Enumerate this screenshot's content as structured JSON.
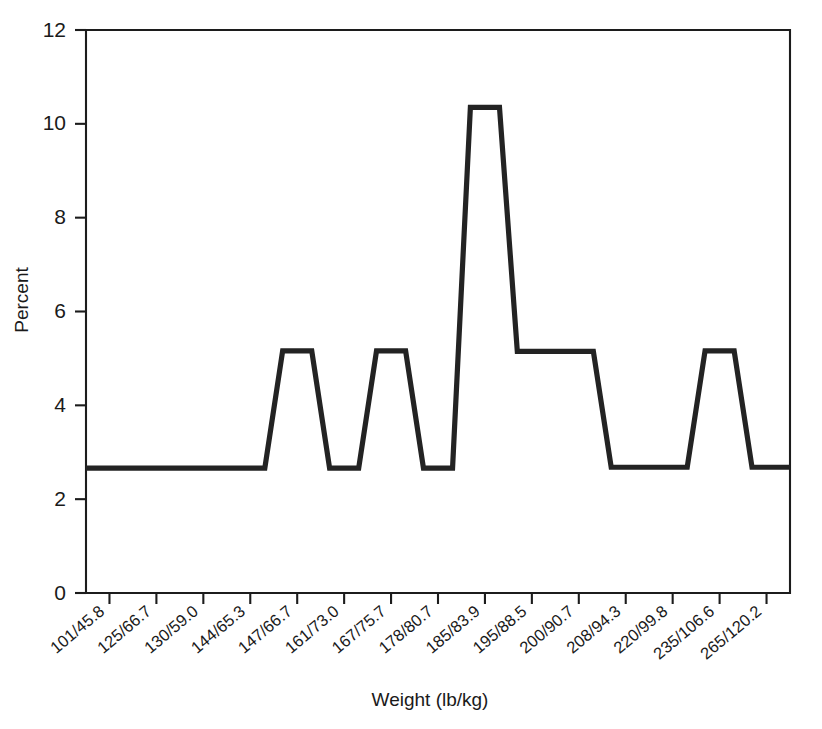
{
  "chart_data": {
    "type": "line",
    "title": "",
    "subtitle": "",
    "xlabel": "Weight (lb/kg)",
    "ylabel": "Percent",
    "categories": [
      "101/45.8",
      "125/66.7",
      "130/59.0",
      "144/65.3",
      "147/66.7",
      "161/73.0",
      "167/75.7",
      "178/80.7",
      "185/83.9",
      "195/88.5",
      "200/90.7",
      "208/94.3",
      "220/99.8",
      "235/106.6",
      "265/120.2"
    ],
    "values": [
      2.66,
      2.66,
      2.66,
      2.66,
      5.16,
      2.66,
      5.16,
      2.66,
      10.35,
      5.15,
      5.15,
      2.68,
      2.68,
      5.16,
      2.68
    ],
    "series": [
      {
        "name": "Percent",
        "values": [
          2.66,
          2.66,
          2.66,
          2.66,
          5.16,
          2.66,
          5.16,
          2.66,
          10.35,
          5.15,
          5.15,
          2.68,
          2.68,
          5.16,
          2.68
        ]
      }
    ],
    "yticks": [
      0,
      2,
      4,
      6,
      8,
      10,
      12
    ],
    "ytick_labels": [
      "0",
      "2",
      "4",
      "6",
      "8",
      "10",
      "12"
    ],
    "ylim": [
      0,
      12
    ],
    "xlim": [
      0,
      14
    ],
    "grid": false,
    "legend": false,
    "legend_position": "none",
    "line_color": "#232323",
    "axis_color": "#1c1c1c",
    "background_color": "#ffffff",
    "annotations": []
  },
  "axes": {
    "y_title": "Percent",
    "x_title": "Weight (lb/kg)"
  }
}
